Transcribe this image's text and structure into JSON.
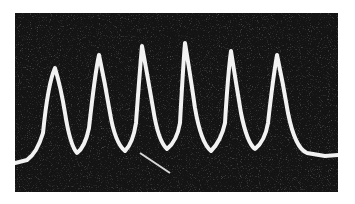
{
  "image": {
    "description": "Oscilloscope trace photograph showing six periodic sharp peaks on a dark noisy background",
    "peak_count": 6,
    "colors": {
      "background": "#141414",
      "trace": "#f2f2f2",
      "page": "#ffffff"
    }
  }
}
